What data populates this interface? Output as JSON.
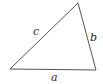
{
  "diagram": {
    "type": "triangle",
    "vertices": {
      "bottom_left": {
        "x": 10,
        "y": 69
      },
      "bottom_right": {
        "x": 96,
        "y": 70
      },
      "top": {
        "x": 78,
        "y": 3
      }
    },
    "sides": [
      {
        "label": "a",
        "from": "bottom_left",
        "to": "bottom_right",
        "label_pos": {
          "x": 54,
          "y": 80
        }
      },
      {
        "label": "b",
        "from": "bottom_right",
        "to": "top",
        "label_pos": {
          "x": 91,
          "y": 41
        }
      },
      {
        "label": "c",
        "from": "bottom_left",
        "to": "top",
        "label_pos": {
          "x": 34,
          "y": 35
        }
      }
    ],
    "stroke_color": "#555555"
  }
}
